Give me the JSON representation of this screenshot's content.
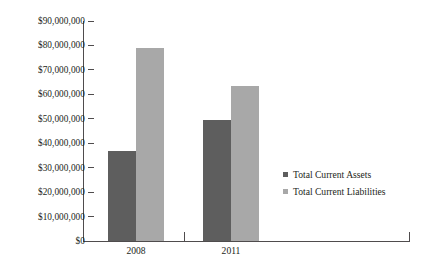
{
  "chart_data": {
    "type": "bar",
    "title": "",
    "xlabel": "",
    "ylabel": "",
    "categories": [
      "2008",
      "2011"
    ],
    "series": [
      {
        "name": "Total Current Assets",
        "color": "#5e5e5e",
        "values": [
          37000000,
          49500000
        ]
      },
      {
        "name": "Total Current Liabilities",
        "color": "#a8a8a8",
        "values": [
          79000000,
          63500000
        ]
      }
    ],
    "ylim": [
      0,
      90000000
    ],
    "ytick_values": [
      0,
      10000000,
      20000000,
      30000000,
      40000000,
      50000000,
      60000000,
      70000000,
      80000000,
      90000000
    ],
    "ytick_labels": [
      "$90,000,000",
      "$80,000,000",
      "$70,000,000",
      "$60,000,000",
      "$50,000,000",
      "$40,000,000",
      "$30,000,000",
      "$20,000,000",
      "$10,000,000",
      "$0"
    ],
    "grid": false,
    "legend_position": "right-middle",
    "axis_color": "#4f4c4d",
    "background": "#ffffff"
  }
}
